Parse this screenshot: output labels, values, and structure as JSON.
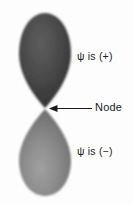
{
  "figure": {
    "background_color": "#fdfdfd",
    "labels": {
      "upper_lobe": "ψ is (+)",
      "lower_lobe": "ψ is (−)",
      "node": "Node"
    },
    "upper_lobe": {
      "name": "upper-lobe",
      "sign": "+",
      "fill_color": "#4a4a4a",
      "edge_color": "#2e2e2e"
    },
    "lower_lobe": {
      "name": "lower-lobe",
      "sign": "−",
      "fill_color": "#8d8d8d",
      "edge_color": "#6f6f6f"
    },
    "node_marker": {
      "name": "node-point",
      "x": 45,
      "y": 108
    },
    "annotation_arrow": {
      "name": "node-arrow",
      "color": "#1a1a1a",
      "from_x": 92,
      "to_x": 50,
      "y": 108
    }
  }
}
